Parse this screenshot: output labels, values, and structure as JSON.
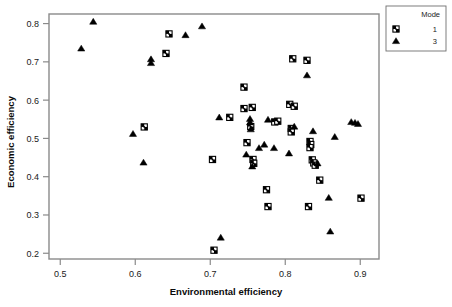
{
  "chart_data": {
    "type": "scatter",
    "title": "",
    "xlabel": "Environmental efficiency",
    "ylabel": "Economic efficiency",
    "xlim": [
      0.485,
      0.925
    ],
    "ylim": [
      0.185,
      0.825
    ],
    "xticks": [
      0.5,
      0.6,
      0.7,
      0.8,
      0.9
    ],
    "xtick_labels": [
      "0.5",
      "0.6",
      "0.7",
      "0.8",
      "0.9"
    ],
    "yticks": [
      0.2,
      0.3,
      0.4,
      0.5,
      0.6,
      0.7,
      0.8
    ],
    "ytick_labels": [
      "0.2",
      "0.3",
      "0.4",
      "0.5",
      "0.6",
      "0.7",
      "0.8"
    ],
    "grid": false,
    "legend": {
      "title": "Mode",
      "position": "top-right-outside",
      "entries": [
        {
          "label": "1",
          "marker": "crossed-square",
          "color": "#000000"
        },
        {
          "label": "3",
          "marker": "filled-triangle",
          "color": "#000000"
        }
      ]
    },
    "series": [
      {
        "name": "1",
        "marker": "crossed-square",
        "color": "#000000",
        "points": [
          [
            0.645,
            0.773
          ],
          [
            0.641,
            0.722
          ],
          [
            0.612,
            0.53
          ],
          [
            0.703,
            0.445
          ],
          [
            0.705,
            0.208
          ],
          [
            0.726,
            0.555
          ],
          [
            0.745,
            0.634
          ],
          [
            0.745,
            0.578
          ],
          [
            0.756,
            0.581
          ],
          [
            0.754,
            0.531
          ],
          [
            0.749,
            0.489
          ],
          [
            0.757,
            0.445
          ],
          [
            0.758,
            0.435
          ],
          [
            0.775,
            0.366
          ],
          [
            0.777,
            0.322
          ],
          [
            0.786,
            0.543
          ],
          [
            0.79,
            0.545
          ],
          [
            0.806,
            0.589
          ],
          [
            0.812,
            0.584
          ],
          [
            0.81,
            0.708
          ],
          [
            0.829,
            0.704
          ],
          [
            0.808,
            0.526
          ],
          [
            0.808,
            0.517
          ],
          [
            0.833,
            0.492
          ],
          [
            0.834,
            0.484
          ],
          [
            0.833,
            0.476
          ],
          [
            0.836,
            0.444
          ],
          [
            0.838,
            0.436
          ],
          [
            0.84,
            0.43
          ],
          [
            0.846,
            0.391
          ],
          [
            0.831,
            0.322
          ],
          [
            0.901,
            0.344
          ]
        ]
      },
      {
        "name": "3",
        "marker": "filled-triangle",
        "color": "#000000",
        "points": [
          [
            0.528,
            0.735
          ],
          [
            0.544,
            0.805
          ],
          [
            0.597,
            0.512
          ],
          [
            0.611,
            0.437
          ],
          [
            0.621,
            0.707
          ],
          [
            0.621,
            0.697
          ],
          [
            0.667,
            0.77
          ],
          [
            0.689,
            0.793
          ],
          [
            0.712,
            0.555
          ],
          [
            0.714,
            0.241
          ],
          [
            0.748,
            0.458
          ],
          [
            0.753,
            0.551
          ],
          [
            0.753,
            0.542
          ],
          [
            0.754,
            0.524
          ],
          [
            0.756,
            0.427
          ],
          [
            0.765,
            0.475
          ],
          [
            0.772,
            0.484
          ],
          [
            0.777,
            0.549
          ],
          [
            0.785,
            0.475
          ],
          [
            0.805,
            0.461
          ],
          [
            0.812,
            0.531
          ],
          [
            0.829,
            0.665
          ],
          [
            0.837,
            0.519
          ],
          [
            0.843,
            0.435
          ],
          [
            0.858,
            0.345
          ],
          [
            0.86,
            0.257
          ],
          [
            0.866,
            0.504
          ],
          [
            0.888,
            0.543
          ],
          [
            0.893,
            0.541
          ],
          [
            0.897,
            0.538
          ]
        ]
      }
    ]
  },
  "figure": {
    "background": "#ffffff",
    "axis_color": "#8a8a8a",
    "marker_color": "#000000"
  }
}
